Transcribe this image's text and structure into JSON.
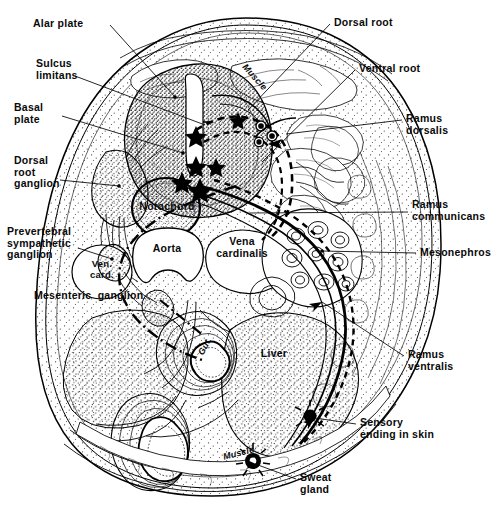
{
  "figure": {
    "kind": "anatomical-diagram",
    "background_color": "#ffffff",
    "ink_color": "#000000",
    "width": 493,
    "height": 522
  },
  "labels": {
    "alar_plate": "Alar plate",
    "sulcus_limitans": "Sulcus\nlimitans",
    "basal_plate": "Basal\nplate",
    "dorsal_root_ganglion": "Dorsal\nroot\nganglion",
    "prevertebral_sympathetic_ganglion": "Prevertebral\nsympathetic\nganglion",
    "mesenteric_ganglion": "Mesenteric  ganglion",
    "dorsal_root": "Dorsal root",
    "ventral_root": "Ventral root",
    "ramus_dorsalis": "Ramus\ndorsalis",
    "ramus_communicans": "Ramus\ncommunicans",
    "mesonephros": "Mesonephros",
    "ramus_ventralis": "Ramus\nventralis",
    "sensory_ending_in_skin": "Sensory\nending in skin",
    "sweat_gland": "Sweat\ngland"
  },
  "inline_labels": {
    "notochord": "Notochord",
    "aorta": "Aorta",
    "vena_cardinalis": "Vena\ncardinalis",
    "ven_card": "Ven.\ncard.",
    "liver": "Liver",
    "gut": "Gut",
    "muscle_dorsal": "Muscle",
    "muscle_ventral": "Muscle"
  },
  "structures": [
    {
      "name": "neural-tube",
      "note": "spinal cord with central canal, alar and basal plates"
    },
    {
      "name": "notochord"
    },
    {
      "name": "aorta"
    },
    {
      "name": "vena-cardinalis"
    },
    {
      "name": "ven-card",
      "note": "left cardinal vein"
    },
    {
      "name": "mesonephros"
    },
    {
      "name": "liver"
    },
    {
      "name": "gut"
    },
    {
      "name": "dorsal-root-ganglion"
    },
    {
      "name": "prevertebral-sympathetic-ganglion"
    },
    {
      "name": "mesenteric-ganglion"
    },
    {
      "name": "sweat-gland"
    },
    {
      "name": "dorsal-muscle-mass"
    },
    {
      "name": "ventral-body-wall"
    }
  ]
}
